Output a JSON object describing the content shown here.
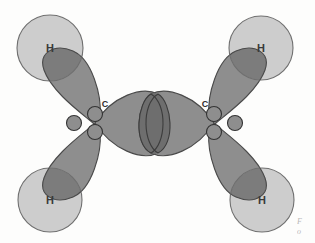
{
  "figure": {
    "background_color": "#fdfdfc"
  },
  "colors": {
    "hydrogen_fill": "#c9c9c9",
    "hydrogen_stroke": "#6f6f6f",
    "orbital_fill": "#8e8e8e",
    "orbital_stroke": "#4a4a4a",
    "overlap_fill": "#6e6e6e",
    "overlap_stroke": "#3c3c3c",
    "p_orbital_fill": "#8e8e8e",
    "p_orbital_stroke": "#333333",
    "label_color": "#3a3a3a"
  },
  "atoms": {
    "hydrogens": [
      {
        "id": "h-top-left",
        "label": "H",
        "cx": 50,
        "cy": 48,
        "r": 33
      },
      {
        "id": "h-top-right",
        "label": "H",
        "cx": 261,
        "cy": 48,
        "r": 32
      },
      {
        "id": "h-bottom-left",
        "label": "H",
        "cx": 50,
        "cy": 200,
        "r": 32
      },
      {
        "id": "h-bottom-right",
        "label": "H",
        "cx": 262,
        "cy": 200,
        "r": 32
      }
    ],
    "carbons": [
      {
        "id": "c-left",
        "label": "C",
        "cx": 93,
        "cy": 123,
        "label_x": 105,
        "label_y": 104
      },
      {
        "id": "c-right",
        "label": "C",
        "cx": 216,
        "cy": 123,
        "label_x": 205,
        "label_y": 104
      }
    ]
  },
  "orbitals": {
    "sp2_lobes": [
      {
        "id": "lobe-left-upper",
        "from": "c-left",
        "toward": "h-top-left"
      },
      {
        "id": "lobe-left-lower",
        "from": "c-left",
        "toward": "h-bottom-left"
      },
      {
        "id": "lobe-left-inner",
        "from": "c-left",
        "toward": "center"
      },
      {
        "id": "lobe-right-upper",
        "from": "c-right",
        "toward": "h-top-right"
      },
      {
        "id": "lobe-right-lower",
        "from": "c-right",
        "toward": "h-bottom-right"
      },
      {
        "id": "lobe-right-inner",
        "from": "c-right",
        "toward": "center"
      }
    ],
    "sigma_overlap": {
      "id": "cc-sigma-overlap",
      "cx": 155,
      "cy": 123
    },
    "p_lobe_count_per_carbon": 3
  },
  "caption": {
    "fragment_line_1": "F",
    "fragment_line_2": "o"
  }
}
